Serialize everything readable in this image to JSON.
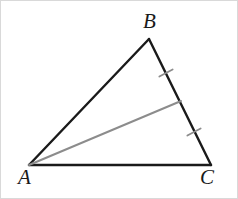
{
  "figure": {
    "background_color": "#ffffff",
    "border_color": "#d9d9d9",
    "width": 238,
    "height": 199
  },
  "labels": {
    "a": "A",
    "b": "B",
    "c": "C"
  },
  "chart_data": {
    "type": "diagram",
    "vertices": [
      {
        "name": "A",
        "x": 28,
        "y": 164
      },
      {
        "name": "B",
        "x": 148,
        "y": 38
      },
      {
        "name": "C",
        "x": 210,
        "y": 164
      }
    ],
    "points": [
      {
        "name": "M",
        "x": 180,
        "y": 100,
        "description": "midpoint of BC, endpoint of median from A"
      }
    ],
    "edges": [
      {
        "name": "AB",
        "from": "A",
        "to": "B",
        "color": "#1a1a1a",
        "width": 2.4
      },
      {
        "name": "BC",
        "from": "B",
        "to": "C",
        "color": "#1a1a1a",
        "width": 2.4
      },
      {
        "name": "AC",
        "from": "A",
        "to": "C",
        "color": "#1a1a1a",
        "width": 2.4
      }
    ],
    "cevian": {
      "name": "AM",
      "from": "A",
      "to": "M",
      "color": "#8c8c8c",
      "width": 2.0,
      "description": "median drawn from vertex A to midpoint M of side BC"
    },
    "tick_marks": [
      {
        "name": "tick-BM",
        "on_segment": "BM",
        "x": 165,
        "y": 72,
        "angle_deg": -28,
        "length": 15,
        "color": "#8c8c8c",
        "width": 1.8
      },
      {
        "name": "tick-MC",
        "on_segment": "MC",
        "x": 193,
        "y": 131,
        "angle_deg": -28,
        "length": 15,
        "color": "#8c8c8c",
        "width": 1.8
      }
    ],
    "annotations": [
      "Single tick on BM and single tick on MC indicate BM = MC (congruent segments)."
    ],
    "colors": {
      "stroke_dark": "#1a1a1a",
      "stroke_gray": "#8c8c8c",
      "label": "#1a1a1a",
      "background": "#ffffff"
    }
  }
}
